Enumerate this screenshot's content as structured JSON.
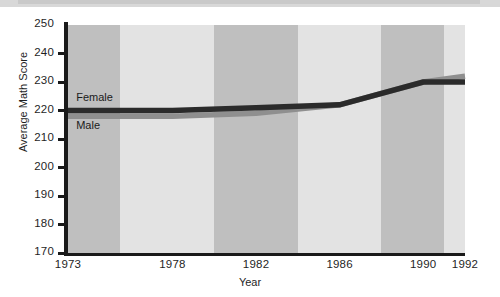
{
  "chart_data": {
    "type": "line",
    "title": "",
    "xlabel": "Year",
    "ylabel": "Average Math Score",
    "categories": [
      "1973",
      "1978",
      "1982",
      "1986",
      "1990",
      "1992"
    ],
    "x": [
      1973,
      1978,
      1982,
      1986,
      1990,
      1992
    ],
    "xlim": [
      1973,
      1992
    ],
    "ylim": [
      170,
      250
    ],
    "yticks": [
      170,
      180,
      190,
      200,
      210,
      220,
      230,
      240,
      250
    ],
    "ytick_labels": [
      "170",
      "180",
      "190",
      "200",
      "210",
      "220",
      "230",
      "240",
      "250"
    ],
    "grid": false,
    "legend_position": "inline-labels",
    "background_bands": "alternating light and medium gray vertical bands between year ticks",
    "series": [
      {
        "name": "Female",
        "color": "#2b2b2b",
        "values": [
          220,
          220,
          221,
          222,
          230,
          230
        ]
      },
      {
        "name": "Male",
        "color": "#8f8f8f",
        "values": [
          218,
          218,
          219,
          222,
          230,
          232
        ]
      }
    ],
    "annotations": [
      {
        "text": "Female",
        "x": 1973.2,
        "y": 224.5
      },
      {
        "text": "Male",
        "x": 1973.2,
        "y": 214.5
      }
    ]
  },
  "colors": {
    "female_line": "#2b2b2b",
    "male_line": "#8f8f8f",
    "band_dark": "#bfbfbf",
    "band_light": "#e3e3e3",
    "axis": "#1a1a1a",
    "text": "#1f1f1f",
    "page_background": "#ffffff"
  },
  "axis": {
    "y_title": "Average Math Score",
    "x_title": "Year"
  }
}
